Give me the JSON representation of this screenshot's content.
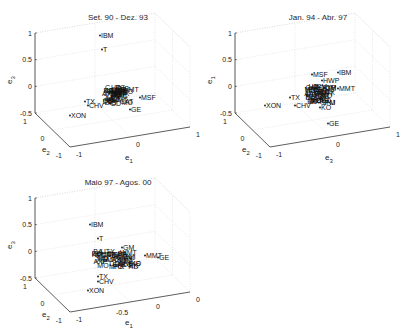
{
  "chart_data": [
    {
      "type": "scatter",
      "title": "Set. 90 - Dez. 93",
      "xlabel": "e1",
      "ylabel": "e2",
      "zlabel": "e3",
      "ticks": {
        "z": [
          "1",
          "0.5",
          "0",
          "-0.5"
        ],
        "y": [
          "1",
          "0",
          "-1"
        ],
        "x": [
          "-1",
          "0",
          "1"
        ]
      },
      "labels": [
        {
          "name": "IBM",
          "x": 0,
          "y": 38
        },
        {
          "name": "T",
          "x": 2,
          "y": 52
        },
        {
          "name": "XON",
          "x": -30,
          "y": 118
        },
        {
          "name": "TX",
          "x": -15,
          "y": 104
        },
        {
          "name": "CHV",
          "x": -12,
          "y": 108
        },
        {
          "name": "MSF",
          "x": 40,
          "y": 100
        },
        {
          "name": "GE",
          "x": 30,
          "y": 112
        },
        {
          "name": "DD",
          "x": 10,
          "y": 106
        }
      ]
    },
    {
      "type": "scatter",
      "title": "Jan. 94 - Abr. 97",
      "xlabel": "e3",
      "ylabel": "e2",
      "zlabel": "e1",
      "ticks": {
        "z": [
          "1",
          "0.5",
          "0",
          "-0.5"
        ],
        "y": [
          "1",
          "0",
          "-1"
        ],
        "x": [
          "-1",
          "0",
          "1"
        ]
      },
      "labels": [
        {
          "name": "IBM",
          "x": 38,
          "y": 75
        },
        {
          "name": "MSF",
          "x": 12,
          "y": 77
        },
        {
          "name": "HWP",
          "x": 22,
          "y": 83
        },
        {
          "name": "MMT",
          "x": 38,
          "y": 91
        },
        {
          "name": "TX",
          "x": -10,
          "y": 100
        },
        {
          "name": "XON",
          "x": -35,
          "y": 108
        },
        {
          "name": "CHV",
          "x": -5,
          "y": 108
        },
        {
          "name": "KO",
          "x": 20,
          "y": 110
        },
        {
          "name": "GE",
          "x": 28,
          "y": 126
        }
      ]
    },
    {
      "type": "scatter",
      "title": "Maio 97 - Agos. 00",
      "xlabel": "e1",
      "ylabel": "e2",
      "zlabel": "e3",
      "ticks": {
        "z": [
          "1",
          "0.5",
          "0",
          "-0.5"
        ],
        "y": [
          "1",
          "0",
          "-1"
        ],
        "x": [
          "-1",
          "-0.5",
          "0",
          "0.5"
        ]
      },
      "labels": [
        {
          "name": "IBM",
          "x": -10,
          "y": 62
        },
        {
          "name": "T",
          "x": -2,
          "y": 76
        },
        {
          "name": "GM",
          "x": 22,
          "y": 85
        },
        {
          "name": "GE",
          "x": 58,
          "y": 95
        },
        {
          "name": "MMT",
          "x": 45,
          "y": 93
        },
        {
          "name": "KO",
          "x": 30,
          "y": 101
        },
        {
          "name": "TX",
          "x": -2,
          "y": 114
        },
        {
          "name": "CHV",
          "x": -2,
          "y": 119
        },
        {
          "name": "XON",
          "x": -12,
          "y": 128
        }
      ]
    }
  ]
}
